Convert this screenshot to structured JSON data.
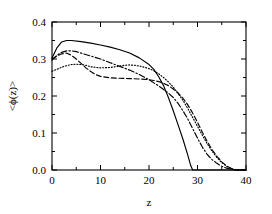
{
  "chart_data": {
    "type": "line",
    "title": "",
    "xlabel": "z",
    "ylabel": "<ϕ(z)>",
    "xlim": [
      0,
      40
    ],
    "ylim": [
      0,
      0.4
    ],
    "grid": false,
    "legend": "none",
    "xticks": [
      0,
      10,
      20,
      30,
      40
    ],
    "xticklabels": [
      "0",
      "10",
      "20",
      "30",
      "40"
    ],
    "xminorticks": [
      5,
      15,
      25,
      35
    ],
    "yticks": [
      0.0,
      0.1,
      0.2,
      0.3,
      0.4
    ],
    "yticklabels": [
      "0.0",
      "0.1",
      "0.2",
      "0.3",
      "0.4"
    ],
    "yminorticks": [
      0.05,
      0.15,
      0.25,
      0.35
    ],
    "series": [
      {
        "name": "solid",
        "style": "solid",
        "color": "#000000",
        "x": [
          0,
          1,
          2,
          3,
          4,
          6,
          8,
          10,
          12,
          14,
          16,
          18,
          20,
          21,
          22,
          23,
          24,
          25,
          26,
          27,
          28,
          28.6,
          29,
          30,
          32,
          34,
          36,
          38,
          40
        ],
        "y": [
          0.303,
          0.33,
          0.346,
          0.35,
          0.35,
          0.347,
          0.343,
          0.338,
          0.332,
          0.325,
          0.316,
          0.303,
          0.285,
          0.272,
          0.252,
          0.228,
          0.196,
          0.16,
          0.122,
          0.083,
          0.04,
          0.012,
          0.0,
          0.0,
          0.0,
          0.0,
          0.0,
          0.0,
          0.0
        ]
      },
      {
        "name": "dash-dot",
        "style": "dashdot",
        "color": "#000000",
        "x": [
          0,
          1,
          2,
          3,
          4,
          5,
          6,
          8,
          10,
          12,
          14,
          16,
          18,
          20,
          22,
          24,
          25,
          26,
          27,
          28,
          29,
          30,
          31,
          32,
          33,
          34,
          35,
          36,
          37,
          38,
          40
        ],
        "y": [
          0.297,
          0.31,
          0.318,
          0.322,
          0.322,
          0.32,
          0.316,
          0.308,
          0.3,
          0.29,
          0.28,
          0.27,
          0.258,
          0.244,
          0.227,
          0.208,
          0.196,
          0.18,
          0.16,
          0.138,
          0.112,
          0.086,
          0.062,
          0.042,
          0.028,
          0.018,
          0.01,
          0.005,
          0.002,
          0.0,
          0.0
        ]
      },
      {
        "name": "dotted",
        "style": "dotted",
        "color": "#000000",
        "x": [
          0,
          1,
          2,
          3,
          4,
          5,
          6,
          7,
          8,
          10,
          12,
          13,
          14,
          15,
          16,
          17,
          18,
          19,
          20,
          21,
          22,
          23,
          24,
          25,
          26,
          27,
          28,
          29,
          30,
          31,
          32,
          33,
          34,
          35,
          36,
          37,
          38,
          40
        ],
        "y": [
          0.267,
          0.272,
          0.278,
          0.282,
          0.285,
          0.286,
          0.285,
          0.283,
          0.279,
          0.276,
          0.277,
          0.279,
          0.281,
          0.283,
          0.284,
          0.283,
          0.281,
          0.278,
          0.274,
          0.268,
          0.26,
          0.25,
          0.238,
          0.224,
          0.207,
          0.188,
          0.166,
          0.142,
          0.118,
          0.094,
          0.071,
          0.051,
          0.034,
          0.02,
          0.01,
          0.004,
          0.0,
          0.0
        ]
      },
      {
        "name": "dashed",
        "style": "dashed",
        "color": "#000000",
        "x": [
          0,
          1,
          2,
          3,
          4,
          5,
          6,
          7,
          8,
          9,
          10,
          12,
          14,
          16,
          18,
          20,
          21,
          22,
          23,
          24,
          25,
          26,
          27,
          28,
          29,
          30,
          31,
          32,
          33,
          34,
          35,
          36,
          37,
          38,
          40
        ],
        "y": [
          0.3,
          0.308,
          0.314,
          0.316,
          0.31,
          0.3,
          0.288,
          0.276,
          0.266,
          0.258,
          0.253,
          0.249,
          0.248,
          0.247,
          0.246,
          0.244,
          0.242,
          0.239,
          0.234,
          0.228,
          0.219,
          0.208,
          0.194,
          0.176,
          0.154,
          0.129,
          0.102,
          0.077,
          0.055,
          0.037,
          0.022,
          0.011,
          0.004,
          0.0,
          0.0
        ]
      }
    ]
  }
}
